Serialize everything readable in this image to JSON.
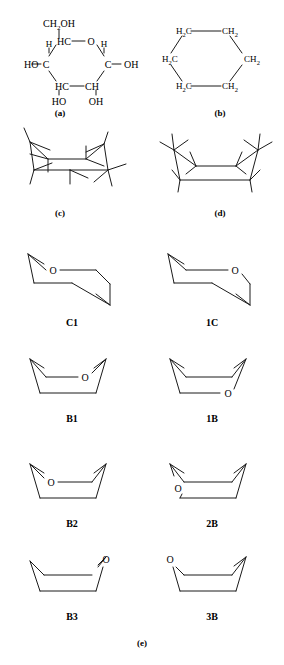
{
  "figure": {
    "stroke_color": "#1a1a1a",
    "background": "#ffffff"
  },
  "panels": [
    {
      "id": "a",
      "caption": "(a)",
      "description": "glucopyranose ring with substituents"
    },
    {
      "id": "b",
      "caption": "(b)",
      "description": "cyclohexane hexagon"
    },
    {
      "id": "c",
      "caption": "(c)",
      "description": "chair conformation with hydrogens"
    },
    {
      "id": "d",
      "caption": "(d)",
      "description": "boat conformation with hydrogens"
    },
    {
      "id": "e",
      "caption": "(e)",
      "description": "ring conformers of the pyranose ring"
    }
  ],
  "panel_a": {
    "top_substituent": {
      "text": "CH",
      "sub": "2",
      "tail": "OH"
    },
    "ring_atoms": {
      "top_left": "HC",
      "top_right": "O",
      "left": "C",
      "right": "C",
      "bottom_left": "HC",
      "bottom_right": "CH"
    },
    "left_hydroxyl": "HO",
    "right_hydroxyl": "OH",
    "left_hydrogen": "H",
    "right_hydrogen": "H",
    "bottom_left_hydroxyl": "HO",
    "bottom_right_hydroxyl": "OH"
  },
  "panel_b": {
    "vertices": [
      {
        "text": "H",
        "sub": "2",
        "tail": "C"
      },
      {
        "text": "CH",
        "sub": "2",
        "tail": ""
      },
      {
        "text": "CH",
        "sub": "2",
        "tail": ""
      },
      {
        "text": "CH",
        "sub": "2",
        "tail": ""
      },
      {
        "text": "H",
        "sub": "2",
        "tail": "C"
      },
      {
        "text": "H",
        "sub": "2",
        "tail": "C"
      }
    ]
  },
  "conformers": [
    {
      "name": "C1",
      "type": "chair",
      "oxygen_label": "O",
      "oxygen_position": "upper-left"
    },
    {
      "name": "1C",
      "type": "chair",
      "oxygen_label": "O",
      "oxygen_position": "upper-right"
    },
    {
      "name": "B1",
      "type": "boat",
      "oxygen_label": "O",
      "oxygen_position": "upper-right"
    },
    {
      "name": "1B",
      "type": "boat",
      "oxygen_label": "O",
      "oxygen_position": "lower-right"
    },
    {
      "name": "B2",
      "type": "boat",
      "oxygen_label": "O",
      "oxygen_position": "upper-left"
    },
    {
      "name": "2B",
      "type": "boat",
      "oxygen_label": "O",
      "oxygen_position": "lower-left"
    },
    {
      "name": "B3",
      "type": "boat",
      "oxygen_label": "O",
      "oxygen_position": "top-right-vertex"
    },
    {
      "name": "3B",
      "type": "boat",
      "oxygen_label": "O",
      "oxygen_position": "top-left-vertex"
    }
  ]
}
